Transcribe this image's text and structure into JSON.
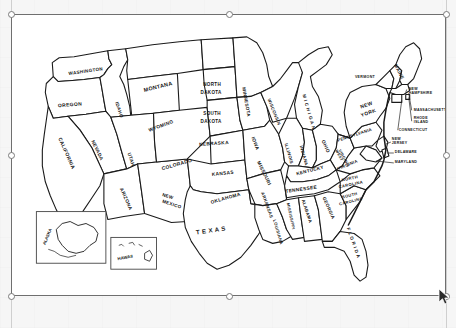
{
  "document": {
    "background_color": "#f6f6f6",
    "canvas_background": "#ffffff"
  },
  "selection": {
    "object_name": "us-states-map-image",
    "border_color": "#6f6f6f",
    "x": 11,
    "y": 14,
    "width": 435,
    "height": 282,
    "handles": [
      {
        "name": "handle-top-left",
        "x": 11,
        "y": 14
      },
      {
        "name": "handle-top-center",
        "x": 228,
        "y": 14
      },
      {
        "name": "handle-top-right",
        "x": 446,
        "y": 14
      },
      {
        "name": "handle-middle-left",
        "x": 11,
        "y": 155
      },
      {
        "name": "handle-middle-right",
        "x": 446,
        "y": 155
      },
      {
        "name": "handle-bottom-left",
        "x": 11,
        "y": 296
      },
      {
        "name": "handle-bottom-center",
        "x": 228,
        "y": 296
      },
      {
        "name": "handle-bottom-right",
        "x": 446,
        "y": 296
      }
    ]
  },
  "cursor": {
    "name": "mouse-pointer",
    "x": 443,
    "y": 292
  },
  "map": {
    "title": "United States of America - Outline Map with State Names",
    "stroke_color": "#1a1a1a",
    "fill_color": "#ffffff",
    "insets": [
      {
        "name": "alaska-inset",
        "label": "ALASKA"
      },
      {
        "name": "hawaii-inset",
        "label": "HAWAII"
      }
    ],
    "states": [
      {
        "code": "WA",
        "label": "WASHINGTON",
        "x": 74,
        "y": 58,
        "rot": -8,
        "size": 4.6
      },
      {
        "code": "OR",
        "label": "OREGON",
        "x": 58,
        "y": 92,
        "rot": -4,
        "size": 5.0
      },
      {
        "code": "ID",
        "label": "IDAHO",
        "x": 106,
        "y": 96,
        "rot": 72,
        "size": 4.6
      },
      {
        "code": "MT",
        "label": "MONTANA",
        "x": 147,
        "y": 74,
        "rot": -14,
        "size": 5.4
      },
      {
        "code": "WY",
        "label": "WYOMING",
        "x": 150,
        "y": 113,
        "rot": -20,
        "size": 4.8
      },
      {
        "code": "NV",
        "label": "NEVADA",
        "x": 84,
        "y": 137,
        "rot": 64,
        "size": 4.8
      },
      {
        "code": "CA",
        "label": "CALIFORNIA",
        "x": 53,
        "y": 140,
        "rot": 66,
        "size": 5.0
      },
      {
        "code": "UT",
        "label": "UTAH",
        "x": 118,
        "y": 146,
        "rot": 72,
        "size": 4.8
      },
      {
        "code": "AZ",
        "label": "ARIZONA",
        "x": 113,
        "y": 186,
        "rot": 66,
        "size": 4.8
      },
      {
        "code": "NM",
        "label": "NEW",
        "x": 156,
        "y": 184,
        "rot": 18,
        "size": 4.6
      },
      {
        "code": "NM2",
        "label": "MEXICO",
        "x": 160,
        "y": 192,
        "rot": 18,
        "size": 4.6
      },
      {
        "code": "CO",
        "label": "COLORADO",
        "x": 166,
        "y": 152,
        "rot": -16,
        "size": 5.0
      },
      {
        "code": "ND",
        "label": "NORTH",
        "x": 201,
        "y": 72,
        "rot": 0,
        "size": 4.6
      },
      {
        "code": "ND2",
        "label": "DAKOTA",
        "x": 200,
        "y": 80,
        "rot": 0,
        "size": 4.6
      },
      {
        "code": "SD",
        "label": "SOUTH",
        "x": 201,
        "y": 101,
        "rot": 0,
        "size": 4.6
      },
      {
        "code": "SD2",
        "label": "DAKOTA",
        "x": 200,
        "y": 109,
        "rot": 0,
        "size": 4.6
      },
      {
        "code": "NE",
        "label": "NEBRASKA",
        "x": 203,
        "y": 131,
        "rot": -4,
        "size": 4.8
      },
      {
        "code": "KS",
        "label": "KANSAS",
        "x": 212,
        "y": 161,
        "rot": -6,
        "size": 4.8
      },
      {
        "code": "OK",
        "label": "OKLAHOMA",
        "x": 215,
        "y": 186,
        "rot": -16,
        "size": 4.8
      },
      {
        "code": "TX",
        "label": "T E X A S",
        "x": 200,
        "y": 219,
        "rot": -8,
        "size": 6.2
      },
      {
        "code": "MN",
        "label": "MINNESOTA",
        "x": 234,
        "y": 88,
        "rot": 80,
        "size": 4.6
      },
      {
        "code": "IA",
        "label": "IOWA",
        "x": 243,
        "y": 130,
        "rot": 70,
        "size": 4.8
      },
      {
        "code": "MO",
        "label": "MISSOURI",
        "x": 252,
        "y": 160,
        "rot": 64,
        "size": 4.8
      },
      {
        "code": "AR",
        "label": "ARKANSAS",
        "x": 255,
        "y": 192,
        "rot": 70,
        "size": 4.4
      },
      {
        "code": "LA",
        "label": "LOUISIANA",
        "x": 266,
        "y": 219,
        "rot": 74,
        "size": 4.2
      },
      {
        "code": "WI",
        "label": "WISCONSIN",
        "x": 262,
        "y": 98,
        "rot": 68,
        "size": 4.4
      },
      {
        "code": "MI",
        "label": "M I C H I G A N",
        "x": 297,
        "y": 98,
        "rot": 74,
        "size": 4.6
      },
      {
        "code": "IL",
        "label": "ILLINOIS",
        "x": 277,
        "y": 140,
        "rot": 74,
        "size": 4.4
      },
      {
        "code": "IN",
        "label": "INDIANA",
        "x": 292,
        "y": 142,
        "rot": 74,
        "size": 4.4
      },
      {
        "code": "OH",
        "label": "OHIO",
        "x": 314,
        "y": 133,
        "rot": 66,
        "size": 4.8
      },
      {
        "code": "WV",
        "label": "WEST",
        "x": 328,
        "y": 142,
        "rot": 62,
        "size": 3.8
      },
      {
        "code": "WV2",
        "label": "VIRGINIA",
        "x": 333,
        "y": 145,
        "rot": 62,
        "size": 3.8
      },
      {
        "code": "KY",
        "label": "KENTUCKY",
        "x": 300,
        "y": 158,
        "rot": -14,
        "size": 4.6
      },
      {
        "code": "TN",
        "label": "TENNESSEE",
        "x": 291,
        "y": 177,
        "rot": -8,
        "size": 4.8
      },
      {
        "code": "MS",
        "label": "MISSISSIPPI",
        "x": 279,
        "y": 203,
        "rot": 78,
        "size": 4.0
      },
      {
        "code": "AL",
        "label": "ALABAMA",
        "x": 295,
        "y": 198,
        "rot": 72,
        "size": 4.4
      },
      {
        "code": "GA",
        "label": "GEORGIA",
        "x": 317,
        "y": 195,
        "rot": 66,
        "size": 4.6
      },
      {
        "code": "FL",
        "label": "F L O R I D A",
        "x": 342,
        "y": 230,
        "rot": 70,
        "size": 4.6
      },
      {
        "code": "SC",
        "label": "SOUTH",
        "x": 340,
        "y": 183,
        "rot": -14,
        "size": 4.0
      },
      {
        "code": "SC2",
        "label": "CAROLINA",
        "x": 341,
        "y": 189,
        "rot": -14,
        "size": 4.0
      },
      {
        "code": "NC",
        "label": "NORTH",
        "x": 340,
        "y": 166,
        "rot": -12,
        "size": 4.2
      },
      {
        "code": "NC2",
        "label": "CAROLINA",
        "x": 341,
        "y": 172,
        "rot": -12,
        "size": 4.2
      },
      {
        "code": "VA",
        "label": "VIRGINIA",
        "x": 338,
        "y": 152,
        "rot": -22,
        "size": 4.2
      },
      {
        "code": "PA",
        "label": "PENNSYLVANIA",
        "x": 345,
        "y": 122,
        "rot": -18,
        "size": 4.2
      },
      {
        "code": "NY",
        "label": "NEW",
        "x": 357,
        "y": 92,
        "rot": -20,
        "size": 5.0
      },
      {
        "code": "NY2",
        "label": "YORK",
        "x": 359,
        "y": 100,
        "rot": -20,
        "size": 5.0
      },
      {
        "code": "VT",
        "label": "VERMONT",
        "x": 355,
        "y": 63,
        "rot": 0,
        "size": 3.6
      },
      {
        "code": "ME",
        "label": "MAINE",
        "x": 388,
        "y": 58,
        "rot": 62,
        "size": 4.6
      }
    ],
    "callouts": [
      {
        "code": "NH",
        "label": "NEW",
        "x": 399,
        "y": 76
      },
      {
        "code": "NH2",
        "label": "HAMPSHIRE",
        "x": 399,
        "y": 80
      },
      {
        "code": "MA",
        "label": "MASSACHUSETTS",
        "x": 404,
        "y": 97
      },
      {
        "code": "RI",
        "label": "RHODE",
        "x": 404,
        "y": 105
      },
      {
        "code": "RI2",
        "label": "ISLAND",
        "x": 404,
        "y": 109
      },
      {
        "code": "CT",
        "label": "CONNECTICUT",
        "x": 389,
        "y": 117
      },
      {
        "code": "NJ",
        "label": "NEW",
        "x": 382,
        "y": 126
      },
      {
        "code": "NJ2",
        "label": "JERSEY",
        "x": 382,
        "y": 130
      },
      {
        "code": "DE",
        "label": "DELAWARE",
        "x": 385,
        "y": 139
      },
      {
        "code": "MD",
        "label": "MARYLAND",
        "x": 385,
        "y": 149
      }
    ]
  }
}
